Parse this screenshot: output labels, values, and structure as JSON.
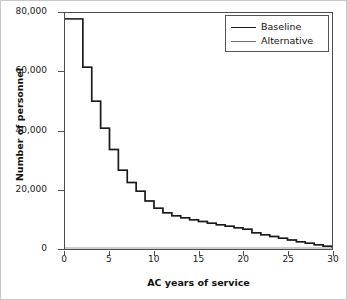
{
  "chart_data": {
    "type": "line",
    "subtype": "step",
    "title": "",
    "xlabel": "AC years of service",
    "ylabel": "Number of personnel",
    "xlim": [
      0,
      30
    ],
    "ylim": [
      0,
      80000
    ],
    "xticks": [
      0,
      5,
      10,
      15,
      20,
      25,
      30
    ],
    "xtick_labels": [
      "0",
      "5",
      "10",
      "15",
      "20",
      "25",
      "30"
    ],
    "yticks": [
      0,
      20000,
      40000,
      60000,
      80000
    ],
    "ytick_labels": [
      "0",
      "20,000",
      "40,000",
      "60,000",
      "80,000"
    ],
    "grid": false,
    "legend_position": "top-right",
    "x": [
      0,
      1,
      2,
      3,
      4,
      5,
      6,
      7,
      8,
      9,
      10,
      11,
      12,
      13,
      14,
      15,
      16,
      17,
      18,
      19,
      20,
      21,
      22,
      23,
      24,
      25,
      26,
      27,
      28,
      29,
      30
    ],
    "series": [
      {
        "name": "Baseline",
        "color": "#1a1a1a",
        "values": [
          78000,
          78000,
          61500,
          50000,
          40800,
          33500,
          26500,
          22300,
          19300,
          16000,
          13500,
          12000,
          11000,
          10300,
          9600,
          9000,
          8400,
          7900,
          7400,
          6900,
          6400,
          5200,
          4500,
          3900,
          3300,
          2700,
          2100,
          1600,
          1100,
          600,
          200
        ]
      },
      {
        "name": "Alternative",
        "color": "#6e6e6e",
        "values": [
          78000,
          78000,
          61500,
          50000,
          40800,
          33500,
          26500,
          22300,
          19300,
          16000,
          13500,
          12000,
          11000,
          10300,
          9600,
          9000,
          8400,
          7900,
          7400,
          6900,
          6400,
          5200,
          4500,
          3900,
          3300,
          2700,
          2100,
          1600,
          1100,
          600,
          200
        ]
      }
    ]
  },
  "legend": {
    "items": [
      {
        "label": "Baseline"
      },
      {
        "label": "Alternative"
      }
    ]
  },
  "axes": {
    "x_label": "AC years of service",
    "y_label": "Number of personnel"
  }
}
